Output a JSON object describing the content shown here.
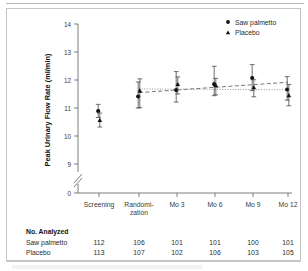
{
  "figure": {
    "frame_color": "#c4c4c4",
    "background": "#ffffff"
  },
  "chart_data": {
    "type": "line",
    "title": "",
    "xlabel": "",
    "ylabel": "Peak Urinary Flow Rate (ml/min)",
    "categories": [
      "Screening",
      "Randomi-zation",
      "Mo 3",
      "Mo 6",
      "Mo 9",
      "Mo 12"
    ],
    "ylim": [
      9,
      14
    ],
    "yticks": [
      "14",
      "13",
      "12",
      "11",
      "10",
      "9",
      "0"
    ],
    "axis_break": true,
    "grid": false,
    "legend_position": "top-right",
    "series": [
      {
        "name": "Saw palmetto",
        "marker": "circle",
        "values": [
          10.89,
          11.41,
          11.64,
          11.85,
          12.07,
          11.66
        ],
        "err_low": [
          10.66,
          11.0,
          11.21,
          11.44,
          11.62,
          11.28
        ],
        "err_high": [
          11.13,
          11.93,
          12.3,
          12.49,
          12.55,
          12.12
        ],
        "trend_start": 11.55,
        "trend_end": 11.92,
        "line_style": "dashed"
      },
      {
        "name": "Placebo",
        "marker": "triangle",
        "values": [
          10.57,
          11.62,
          11.85,
          11.81,
          11.74,
          11.45
        ],
        "err_low": [
          10.32,
          11.01,
          11.5,
          11.47,
          11.4,
          11.08
        ],
        "err_high": [
          10.82,
          12.04,
          12.11,
          12.06,
          12.01,
          11.84
        ],
        "trend_start": 11.68,
        "trend_end": 11.65,
        "line_style": "dotted"
      }
    ]
  },
  "legend": {
    "items": [
      {
        "label": "Saw palmetto",
        "marker": "circle"
      },
      {
        "label": "Placebo",
        "marker": "triangle"
      }
    ]
  },
  "analyzed_table": {
    "title": "No. Analyzed",
    "rows": [
      {
        "label": "Saw palmetto",
        "values": [
          "112",
          "106",
          "101",
          "101",
          "100",
          "101"
        ]
      },
      {
        "label": "Placebo",
        "values": [
          "113",
          "107",
          "102",
          "106",
          "103",
          "105"
        ]
      }
    ]
  }
}
